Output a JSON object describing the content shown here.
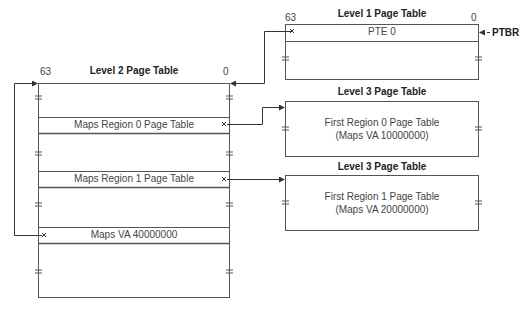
{
  "diagram": {
    "level1": {
      "title": "Level 1 Page Table",
      "bit_high": "63",
      "bit_low": "0",
      "entry": "PTE 0",
      "pointer_label": "PTBR"
    },
    "level2": {
      "title": "Level 2 Page Table",
      "bit_high": "63",
      "bit_low": "0",
      "rows": [
        {
          "label": "Maps Region 0 Page Table"
        },
        {
          "label": "Maps Region 1 Page Table"
        },
        {
          "label": "Maps VA 40000000"
        }
      ]
    },
    "level3": [
      {
        "title": "Level 3 Page Table",
        "line1": "First Region 0 Page Table",
        "line2": "(Maps VA 10000000)"
      },
      {
        "title": "Level 3 Page Table",
        "line1": "First Region 1 Page Table",
        "line2": "(Maps VA 20000000)"
      }
    ],
    "colors": {
      "line": "#555555",
      "text": "#333333"
    }
  }
}
